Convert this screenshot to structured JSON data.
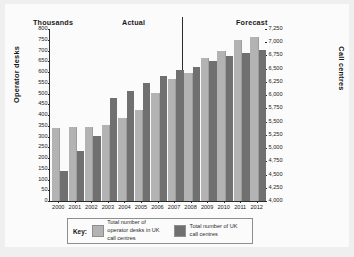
{
  "chart_data": {
    "type": "bar",
    "title": "",
    "subtitle": "",
    "xlabel": "",
    "ylabel": "Operator desks",
    "y2label": "Call centres",
    "unit_note": "Thousands",
    "grid": false,
    "legend_position": "bottom",
    "categories": [
      "2000",
      "2001",
      "2002",
      "2003",
      "2004",
      "2005",
      "2006",
      "2007",
      "2008",
      "2009",
      "2010",
      "2011",
      "2012"
    ],
    "annotations": [
      "Actual",
      "Forecast"
    ],
    "forecast_starts_at": "2008",
    "ylim": [
      0,
      800
    ],
    "y2lim": [
      4000,
      7250
    ],
    "yticks": [
      0,
      50,
      100,
      150,
      200,
      250,
      300,
      350,
      400,
      450,
      500,
      550,
      600,
      650,
      700,
      750,
      800
    ],
    "y2ticks": [
      4000,
      4250,
      4500,
      4750,
      5000,
      5250,
      5500,
      5750,
      6000,
      6250,
      6500,
      6750,
      7000,
      7250
    ],
    "ytick_labels": [
      "0",
      "50",
      "100",
      "150",
      "200",
      "250",
      "300",
      "350",
      "400",
      "450",
      "500",
      "550",
      "600",
      "650",
      "700",
      "750",
      "800"
    ],
    "y2tick_labels": [
      "4,000",
      "4,250",
      "4,500",
      "4,750",
      "5,000",
      "5,250",
      "5,500",
      "5,750",
      "6,000",
      "6,250",
      "6,500",
      "6,750",
      "7,000",
      "7,250"
    ],
    "series": [
      {
        "name": "Total number of operator desks in UK call centres",
        "axis": "left",
        "color": "#b3b3b3",
        "values": [
          338,
          345,
          346,
          352,
          387,
          422,
          504,
          568,
          597,
          663,
          699,
          751,
          765
        ]
      },
      {
        "name": "Total number of UK call centres",
        "axis": "right",
        "color": "#707070",
        "values": [
          4568,
          4945,
          5229,
          5953,
          6087,
          6234,
          6360,
          6470,
          6539,
          6640,
          6746,
          6791,
          6860
        ]
      }
    ]
  },
  "headers": {
    "thousands": "Thousands",
    "actual": "Actual",
    "forecast": "Forecast"
  },
  "axes": {
    "left_title": "Operator desks",
    "right_title": "Call centres"
  },
  "legend": {
    "title": "Key:",
    "entries": [
      {
        "label": "Total number of operator desks in UK call centres",
        "color": "#b3b3b3"
      },
      {
        "label": "Total number of UK call centres",
        "color": "#707070"
      }
    ]
  },
  "colors": {
    "light_bar": "#b3b3b3",
    "dark_bar": "#707070",
    "axis": "#2b2b2b",
    "card": "#fbfbfb",
    "page": "#eeefee"
  }
}
